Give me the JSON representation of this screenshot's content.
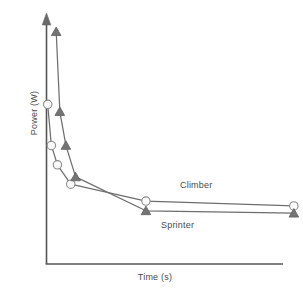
{
  "chart_data": {
    "type": "line",
    "title": "",
    "subtitle": "",
    "xlabel": "Time (s)",
    "ylabel": "Power (W)",
    "grid": false,
    "legend_position": "inline-annotation",
    "axis_style": "schematic-arrow-y",
    "xlim": [
      0,
      100
    ],
    "ylim": [
      0,
      100
    ],
    "x_ticks": [],
    "y_ticks": [],
    "annotations": [
      {
        "text": "Climber",
        "x": 63,
        "y": 36
      },
      {
        "text": "Sprinter",
        "x": 53,
        "y": 20
      }
    ],
    "series": [
      {
        "name": "Climber",
        "marker": "open-circle",
        "color": "#6e6e6e",
        "marker_fill": "#fbfbfb",
        "x": [
          0.5,
          2.0,
          4.5,
          10.0,
          41.0,
          102.0
        ],
        "y": [
          66.0,
          49.0,
          41.0,
          33.0,
          26.0,
          24.0
        ]
      },
      {
        "name": "Sprinter",
        "marker": "filled-triangle",
        "color": "#6e6e6e",
        "marker_fill": "#747474",
        "x": [
          4.0,
          5.5,
          8.0,
          12.0,
          41.0,
          102.0
        ],
        "y": [
          96.0,
          63.0,
          49.0,
          36.0,
          22.0,
          21.0
        ]
      }
    ]
  },
  "axes": {
    "x_label": "Time (s)",
    "y_label": "Power (W)",
    "axis_color": "#555555"
  },
  "annotations": {
    "climber_label": "Climber",
    "sprinter_label": "Sprinter"
  },
  "colors": {
    "axis": "#555555",
    "line": "#6e6e6e",
    "climber_marker_fill": "#fbfbfb",
    "climber_marker_stroke": "#8a8a8a",
    "sprinter_marker_fill": "#747474",
    "sprinter_marker_stroke": "#5e5e5e",
    "text": "#4a4a4a",
    "background": "#ffffff"
  }
}
